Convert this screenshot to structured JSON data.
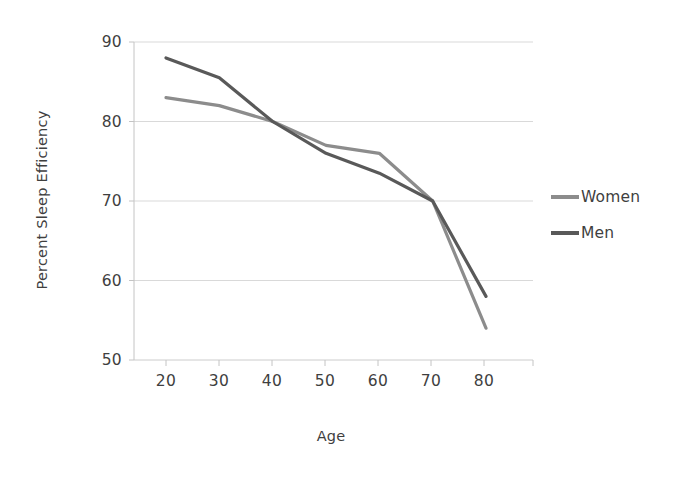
{
  "chart_data": {
    "type": "line",
    "title": "",
    "xlabel": "Age",
    "ylabel": "Percent Sleep Efficiency",
    "x": [
      20,
      30,
      40,
      50,
      60,
      70,
      80
    ],
    "xticks": [
      "20",
      "30",
      "40",
      "50",
      "60",
      "70",
      "80"
    ],
    "yticks": [
      "90",
      "80",
      "70",
      "60",
      "50"
    ],
    "xlim": [
      20,
      80
    ],
    "ylim": [
      50,
      90
    ],
    "grid": "horizontal",
    "legend_position": "right",
    "series": [
      {
        "name": "Women",
        "color": "#8c8c8c",
        "values": [
          83,
          82,
          80,
          77,
          76,
          70,
          54
        ]
      },
      {
        "name": "Men",
        "color": "#595959",
        "values": [
          88,
          85.5,
          80,
          76,
          73.5,
          70,
          58
        ]
      }
    ]
  },
  "axis": {
    "y_title": "Percent Sleep Efficiency",
    "x_title": "Age",
    "y_tick_labels": [
      "90",
      "80",
      "70",
      "60",
      "50"
    ],
    "x_tick_labels": [
      "20",
      "30",
      "40",
      "50",
      "60",
      "70",
      "80"
    ]
  },
  "legend": {
    "items": [
      {
        "label": "Women",
        "color": "#8c8c8c"
      },
      {
        "label": "Men",
        "color": "#595959"
      }
    ]
  },
  "colors": {
    "women_line": "#8c8c8c",
    "men_line": "#595959",
    "gridline": "#d9d9d9",
    "axis": "#bfbfbf",
    "text": "#3f3f3f",
    "background": "#ffffff"
  }
}
